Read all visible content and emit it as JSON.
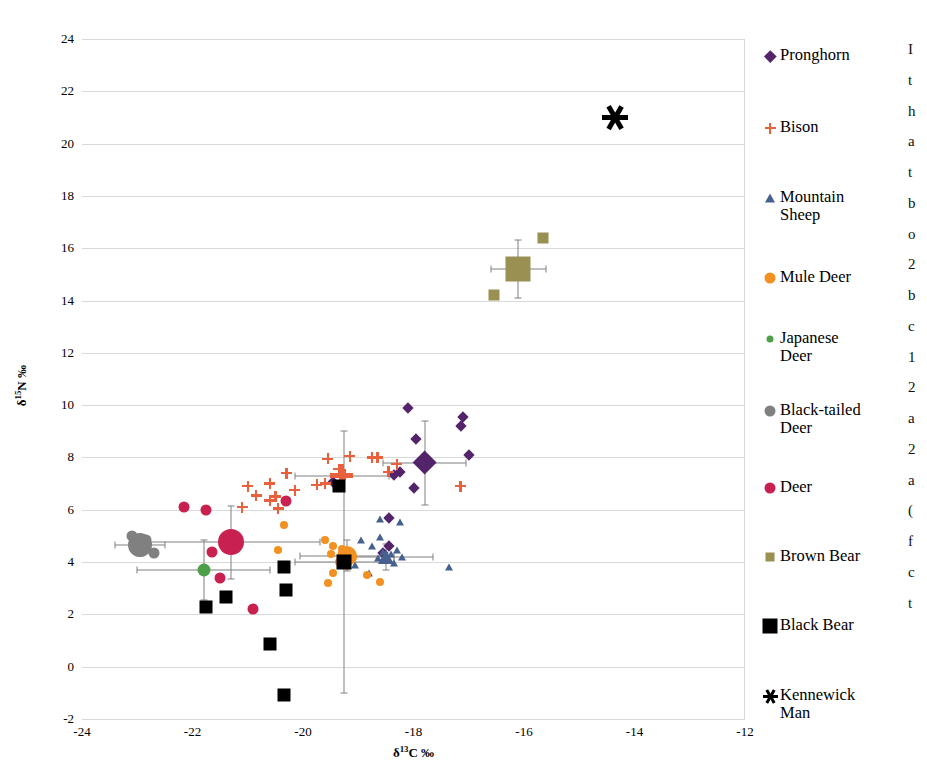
{
  "chart_data": {
    "type": "scatter",
    "title": "",
    "xlabel": "δ13C ‰",
    "ylabel": "δ15N ‰",
    "xlim": [
      -24,
      -12
    ],
    "ylim": [
      -2,
      24
    ],
    "xticks": [
      "-24",
      "-22",
      "-20",
      "-18",
      "-16",
      "-14",
      "-12"
    ],
    "yticks": [
      "24",
      "22",
      "20",
      "18",
      "16",
      "14",
      "12",
      "10",
      "8",
      "6",
      "4",
      "2",
      "0",
      "-2"
    ],
    "grid": true,
    "legend_position": "right",
    "series": [
      {
        "name": "Pronghorn",
        "marker": "diamond",
        "color": "#54246b",
        "mean": {
          "x": -17.8,
          "y": 7.8,
          "xerr": 0.75,
          "yerr": 1.6
        },
        "points": [
          {
            "x": -18.1,
            "y": 9.9
          },
          {
            "x": -17.1,
            "y": 9.55
          },
          {
            "x": -17.15,
            "y": 9.2
          },
          {
            "x": -17.95,
            "y": 8.7
          },
          {
            "x": -17.0,
            "y": 8.1
          },
          {
            "x": -18.25,
            "y": 7.45
          },
          {
            "x": -18.35,
            "y": 7.35
          },
          {
            "x": -19.45,
            "y": 7.05
          },
          {
            "x": -18.0,
            "y": 6.85
          },
          {
            "x": -18.45,
            "y": 5.7
          },
          {
            "x": -18.45,
            "y": 4.6
          },
          {
            "x": -18.55,
            "y": 4.35
          }
        ]
      },
      {
        "name": "Bison",
        "marker": "plus",
        "color": "#e8603c",
        "mean": {
          "x": -19.3,
          "y": 7.3,
          "xerr": 0.85,
          "yerr": 0.0
        },
        "points": [
          {
            "x": -19.15,
            "y": 8.05
          },
          {
            "x": -18.75,
            "y": 8.0
          },
          {
            "x": -18.65,
            "y": 8.0
          },
          {
            "x": -19.55,
            "y": 7.95
          },
          {
            "x": -18.3,
            "y": 7.75
          },
          {
            "x": -18.45,
            "y": 7.45
          },
          {
            "x": -19.35,
            "y": 7.55
          },
          {
            "x": -20.3,
            "y": 7.4
          },
          {
            "x": -20.6,
            "y": 7.0
          },
          {
            "x": -21.0,
            "y": 6.9
          },
          {
            "x": -20.15,
            "y": 6.75
          },
          {
            "x": -19.75,
            "y": 6.95
          },
          {
            "x": -19.6,
            "y": 7.0
          },
          {
            "x": -17.15,
            "y": 6.9
          },
          {
            "x": -20.85,
            "y": 6.55
          },
          {
            "x": -20.5,
            "y": 6.5
          },
          {
            "x": -20.6,
            "y": 6.35
          },
          {
            "x": -21.1,
            "y": 6.1
          },
          {
            "x": -20.45,
            "y": 6.05
          },
          {
            "x": -19.25,
            "y": 7.35
          }
        ]
      },
      {
        "name": "Mountain Sheep",
        "marker": "triangle",
        "color": "#46618f",
        "mean": {
          "x": -18.5,
          "y": 4.2,
          "xerr": 0.85,
          "yerr": 0.5
        },
        "points": [
          {
            "x": -18.6,
            "y": 5.65
          },
          {
            "x": -18.25,
            "y": 5.55
          },
          {
            "x": -18.6,
            "y": 4.95
          },
          {
            "x": -18.95,
            "y": 4.85
          },
          {
            "x": -18.75,
            "y": 4.6
          },
          {
            "x": -18.3,
            "y": 4.45
          },
          {
            "x": -18.55,
            "y": 4.4
          },
          {
            "x": -18.4,
            "y": 4.3
          },
          {
            "x": -18.2,
            "y": 4.2
          },
          {
            "x": -18.65,
            "y": 4.15
          },
          {
            "x": -18.35,
            "y": 3.95
          },
          {
            "x": -19.05,
            "y": 3.9
          },
          {
            "x": -18.8,
            "y": 3.6
          },
          {
            "x": -17.35,
            "y": 3.8
          }
        ]
      },
      {
        "name": "Mule Deer",
        "marker": "circle",
        "color": "#f29021",
        "mean": {
          "x": -19.2,
          "y": 4.25,
          "xerr": 0.85,
          "yerr": 0.6
        },
        "points": [
          {
            "x": -20.35,
            "y": 5.4
          },
          {
            "x": -19.6,
            "y": 4.85
          },
          {
            "x": -19.45,
            "y": 4.6
          },
          {
            "x": -19.3,
            "y": 4.5
          },
          {
            "x": -20.45,
            "y": 4.45
          },
          {
            "x": -19.5,
            "y": 4.3
          },
          {
            "x": -19.1,
            "y": 4.2
          },
          {
            "x": -19.35,
            "y": 4.0
          },
          {
            "x": -19.2,
            "y": 3.85
          },
          {
            "x": -19.45,
            "y": 3.6
          },
          {
            "x": -18.85,
            "y": 3.5
          },
          {
            "x": -19.55,
            "y": 3.2
          },
          {
            "x": -18.6,
            "y": 3.25
          }
        ]
      },
      {
        "name": "Japanese Deer",
        "marker": "circle",
        "color": "#4e9e4a",
        "mean": {
          "x": -21.8,
          "y": 3.7,
          "xerr": 1.2,
          "yerr": 1.15
        },
        "points": []
      },
      {
        "name": "Black-tailed Deer",
        "marker": "circle",
        "color": "#808080",
        "mean": {
          "x": -22.95,
          "y": 4.65,
          "xerr": 0.45,
          "yerr": 0.4
        },
        "points": [
          {
            "x": -23.1,
            "y": 5.0
          },
          {
            "x": -22.85,
            "y": 4.85
          },
          {
            "x": -22.7,
            "y": 4.35
          }
        ]
      },
      {
        "name": "Deer",
        "marker": "circle",
        "color": "#c8204f",
        "mean": {
          "x": -21.3,
          "y": 4.75,
          "xerr": 1.6,
          "yerr": 1.4
        },
        "points": [
          {
            "x": -22.15,
            "y": 6.1
          },
          {
            "x": -21.75,
            "y": 6.0
          },
          {
            "x": -21.65,
            "y": 4.4
          },
          {
            "x": -21.5,
            "y": 3.4
          },
          {
            "x": -20.9,
            "y": 2.2
          },
          {
            "x": -20.3,
            "y": 6.35
          }
        ]
      },
      {
        "name": "Brown Bear",
        "marker": "square",
        "color": "#9a9052",
        "mean": {
          "x": -16.1,
          "y": 15.2,
          "xerr": 0.5,
          "yerr": 1.1
        },
        "points": [
          {
            "x": -15.65,
            "y": 16.4
          },
          {
            "x": -16.55,
            "y": 14.2
          }
        ]
      },
      {
        "name": "Black Bear",
        "marker": "square",
        "color": "#000000",
        "mean": {
          "x": -19.25,
          "y": 4.0,
          "xerr": 0.9,
          "yerr": 5.0
        },
        "points": [
          {
            "x": -20.35,
            "y": 3.8
          },
          {
            "x": -20.3,
            "y": 2.95
          },
          {
            "x": -21.4,
            "y": 2.65
          },
          {
            "x": -21.75,
            "y": 2.3
          },
          {
            "x": -19.35,
            "y": 6.9
          },
          {
            "x": -20.6,
            "y": 0.85
          },
          {
            "x": -20.35,
            "y": -1.1
          }
        ]
      },
      {
        "name": "Kennewick Man",
        "marker": "asterisk",
        "color": "#000000",
        "points": [
          {
            "x": -14.35,
            "y": 21.0
          }
        ]
      }
    ]
  },
  "axes": {
    "x_title": "δ13C ‰",
    "y_title": "δ15N ‰",
    "x_title_delta": "δ",
    "x_title_sup": "13",
    "x_title_rest": "C ‰",
    "y_title_delta": "δ",
    "y_title_sup": "15",
    "y_title_rest": "N ‰"
  },
  "legend": {
    "items": [
      {
        "label": "Pronghorn",
        "marker": "diamond",
        "color": "#54246b"
      },
      {
        "label": "Bison",
        "marker": "plus",
        "color": "#e8603c"
      },
      {
        "label": "Mountain\nSheep",
        "marker": "triangle",
        "color": "#46618f"
      },
      {
        "label": "Mule Deer",
        "marker": "circle",
        "color": "#f29021"
      },
      {
        "label": "Japanese\nDeer",
        "marker": "circle-small",
        "color": "#4e9e4a"
      },
      {
        "label": "Black-tailed\nDeer",
        "marker": "circle",
        "color": "#808080"
      },
      {
        "label": "Deer",
        "marker": "circle",
        "color": "#c8204f"
      },
      {
        "label": "Brown Bear",
        "marker": "square-small",
        "color": "#9a9052"
      },
      {
        "label": "Black Bear",
        "marker": "square",
        "color": "#000000"
      },
      {
        "label": "Kennewick\nMan",
        "marker": "asterisk",
        "color": "#000000"
      }
    ]
  },
  "side_text_sliver": [
    "I",
    "t",
    "h",
    "a",
    "t",
    "b",
    "o",
    "2",
    "b",
    "c",
    "1",
    "2",
    "a",
    "2",
    "a",
    "(",
    "f",
    "c",
    "t"
  ]
}
